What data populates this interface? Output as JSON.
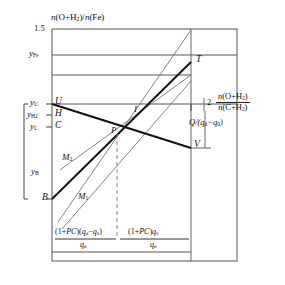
{
  "figure": {
    "type": "line-diagram",
    "axes": {
      "y_axis_label": "n(O+H₂)/n(Fe)",
      "y_axis_label_parts": {
        "lead": "n",
        "open": "(O+H",
        "sub": "2",
        "close": ")/",
        "lead2": "n",
        "open2": "(Fe)"
      },
      "y_top_tick": "1.5",
      "x_axis_label_numerator": "n(O+H₂)",
      "x_axis_label_denominator": "n(C+H₂)",
      "x_tick": "2"
    },
    "y_ticks": [
      {
        "name": "y-Fe",
        "label": "y",
        "sub": "Fe"
      },
      {
        "name": "y-U",
        "label": "y",
        "sub": "U"
      },
      {
        "name": "y-H2",
        "label": "y",
        "sub": "H2",
        "sub_text": "H2"
      },
      {
        "name": "y-C",
        "label": "y",
        "sub": "C"
      },
      {
        "name": "y-B",
        "label": "y",
        "sub": "B"
      }
    ],
    "points": [
      {
        "id": "U",
        "label": "U"
      },
      {
        "id": "H",
        "label": "H"
      },
      {
        "id": "C",
        "label": "C"
      },
      {
        "id": "B",
        "label": "B"
      },
      {
        "id": "P",
        "label": "P"
      },
      {
        "id": "I",
        "label": "I"
      },
      {
        "id": "T",
        "label": "T"
      },
      {
        "id": "V",
        "label": "V"
      }
    ],
    "curves": [
      {
        "id": "M1",
        "label": "M",
        "sub": "1"
      },
      {
        "id": "M2",
        "label": "M",
        "sub": "2"
      }
    ],
    "annotations": {
      "right_bracket": {
        "numerator": "Q",
        "denominator": "(q_d − q_0)",
        "text": "Q/(q_d−q_0)"
      },
      "bottom_left_fraction": {
        "numerator": "(1+PC)(q_d − q_0)",
        "denominator": "q_d"
      },
      "bottom_right_fraction": {
        "numerator": "(1+PC)q_0",
        "denominator": "q_d"
      }
    },
    "colors": {
      "line": "#1a1a1a",
      "thin_line": "#555555",
      "frame": "#4a4a4a",
      "background": "#ffffff",
      "dashed": "#777777"
    }
  }
}
